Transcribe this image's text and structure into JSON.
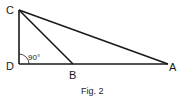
{
  "figure": {
    "caption": "Fig. 2",
    "angle_label": "90°",
    "vertices": {
      "C": {
        "label": "C",
        "x": 19,
        "y": 10
      },
      "D": {
        "label": "D",
        "x": 19,
        "y": 64
      },
      "B": {
        "label": "B",
        "x": 73,
        "y": 64
      },
      "A": {
        "label": "A",
        "x": 168,
        "y": 64
      }
    },
    "segments": [
      "CD",
      "DA",
      "CA",
      "CB"
    ],
    "line_color": "#1a1a1a"
  }
}
